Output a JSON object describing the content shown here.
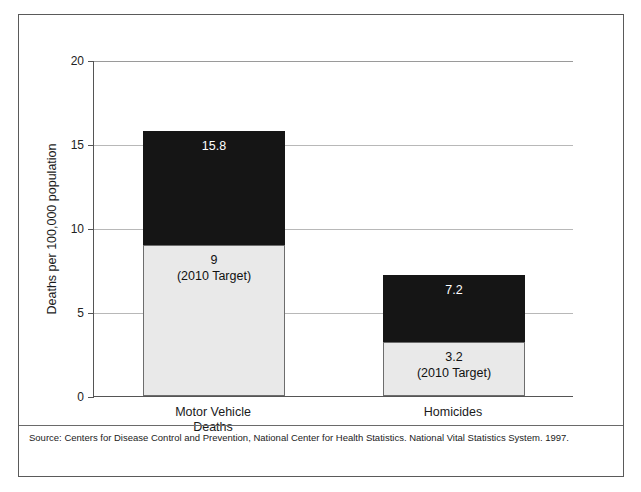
{
  "chart_data": {
    "type": "bar",
    "subtype": "overlapping-target-bar",
    "title": "",
    "xlabel": "",
    "ylabel": "Deaths per 100,000 population",
    "ylim": [
      0,
      20
    ],
    "yticks": [
      0,
      5,
      10,
      15,
      20
    ],
    "ytick_labels": [
      "0",
      "5",
      "10",
      "15",
      "20"
    ],
    "grid": true,
    "grid_axis": "y",
    "legend": "none",
    "categories": [
      "Motor Vehicle Deaths",
      "Homicides"
    ],
    "category_lines": [
      [
        "Motor Vehicle",
        "Deaths"
      ],
      [
        "Homicides"
      ]
    ],
    "series": [
      {
        "name": "Current rate",
        "values": [
          15.8,
          7.2
        ],
        "labels": [
          "15.8",
          "7.2"
        ],
        "color": "#151515"
      },
      {
        "name": "2010 Target",
        "values": [
          9,
          3.2
        ],
        "labels": [
          "9",
          "3.2"
        ],
        "sublabels": [
          "(2010 Target)",
          "(2010 Target)"
        ],
        "color": "#e9e9e9"
      }
    ],
    "source": "Source:  Centers for Disease Control and Prevention, National Center for Health Statistics. National Vital Statistics System. 1997."
  },
  "axis": {
    "y_title": "Deaths per 100,000 population",
    "ticks": [
      {
        "label": "20",
        "value": 20
      },
      {
        "label": "15",
        "value": 15
      },
      {
        "label": "10",
        "value": 10
      },
      {
        "label": "5",
        "value": 5
      },
      {
        "label": "0",
        "value": 0
      }
    ]
  },
  "bars": [
    {
      "category_line1": "Motor Vehicle",
      "category_line2": "Deaths",
      "total_label": "15.8",
      "target_label": "9",
      "target_sub": "(2010 Target)"
    },
    {
      "category_line1": "Homicides",
      "category_line2": "",
      "total_label": "7.2",
      "target_label": "3.2",
      "target_sub": "(2010 Target)"
    }
  ],
  "footer": {
    "source": "Source:  Centers for Disease Control and Prevention, National Center for Health Statistics. National Vital Statistics System. 1997."
  }
}
